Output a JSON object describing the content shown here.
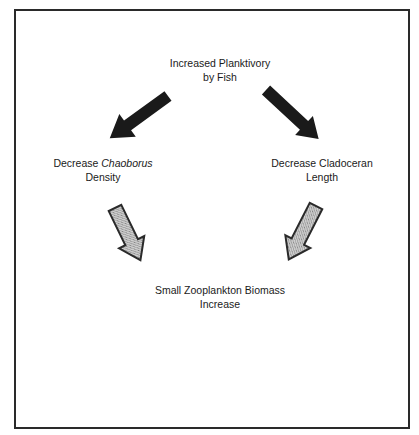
{
  "diagram": {
    "nodes": {
      "top": {
        "line1": "Increased Planktivory",
        "line2": "by Fish"
      },
      "left": {
        "line1_prefix": "Decrease ",
        "line1_italic": "Chaoborus",
        "line2": "Density"
      },
      "right": {
        "line1": "Decrease Cladoceran",
        "line2": "Length"
      },
      "bottom": {
        "line1": "Small Zooplankton Biomass",
        "line2": "Increase"
      }
    },
    "edges": [
      {
        "from": "top",
        "to": "left",
        "style": "solid-black"
      },
      {
        "from": "top",
        "to": "right",
        "style": "solid-black"
      },
      {
        "from": "left",
        "to": "bottom",
        "style": "stippled-gray"
      },
      {
        "from": "right",
        "to": "bottom",
        "style": "stippled-gray"
      }
    ],
    "colors": {
      "solid_arrow": "#1a1a1a",
      "stippled_arrow_fill": "#b8b8b8",
      "stippled_arrow_stroke": "#2a2a2a",
      "frame": "#2a2a2a"
    }
  }
}
